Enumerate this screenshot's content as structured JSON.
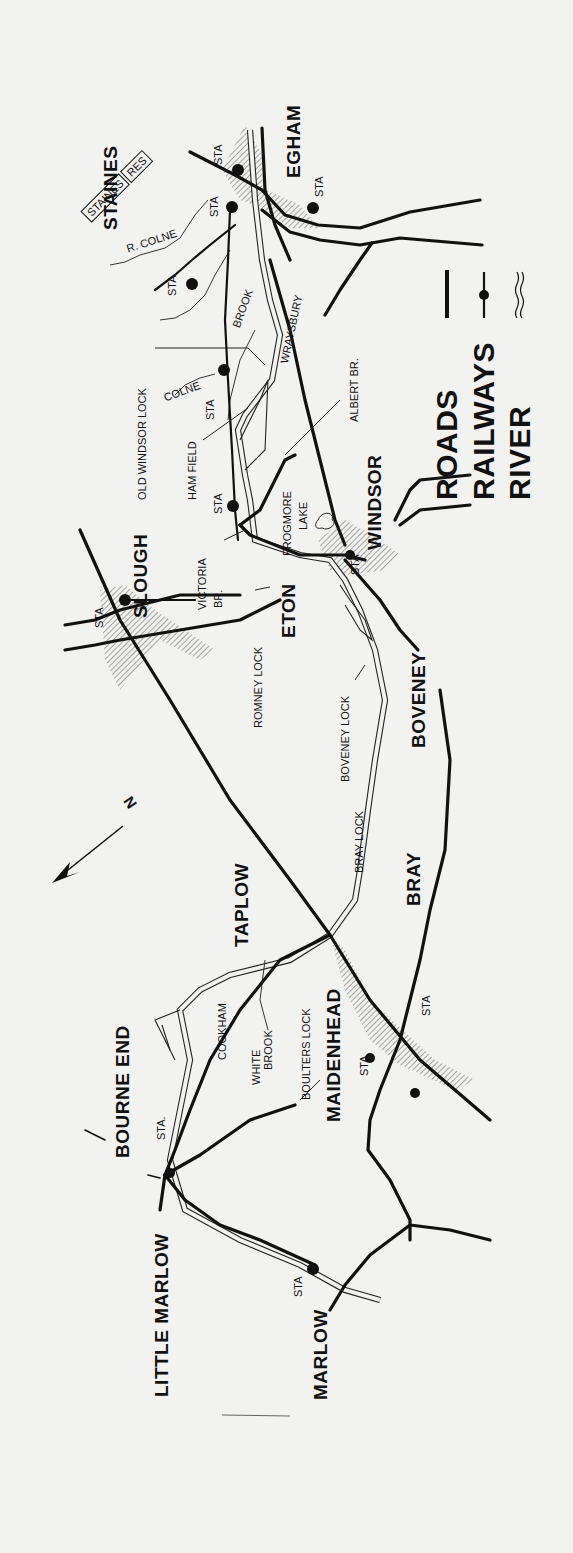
{
  "map": {
    "title": "Thames: Marlow to Staines",
    "orientation": "rotated 90 degrees counter-clockwise",
    "paper_color": "#f2f2f0",
    "ink_color": "#111111",
    "north_arrow": {
      "label": "N",
      "icon": "north-arrow-icon"
    },
    "legend": {
      "items": [
        {
          "label": "ROADS",
          "symbol": "road-line-icon"
        },
        {
          "label": "RAILWAYS",
          "symbol": "railway-line-icon"
        },
        {
          "label": "RIVER",
          "symbol": "river-wavy-icon"
        }
      ]
    },
    "towns": [
      {
        "id": "staines",
        "label": "STAINES"
      },
      {
        "id": "egham",
        "label": "EGHAM"
      },
      {
        "id": "slough",
        "label": "SLOUGH"
      },
      {
        "id": "eton",
        "label": "ETON"
      },
      {
        "id": "windsor",
        "label": "WINDSOR"
      },
      {
        "id": "boveney",
        "label": "BOVENEY"
      },
      {
        "id": "bray",
        "label": "BRAY"
      },
      {
        "id": "taplow",
        "label": "TAPLOW"
      },
      {
        "id": "maidenhead",
        "label": "MAIDENHEAD"
      },
      {
        "id": "bourne_end",
        "label": "BOURNE END"
      },
      {
        "id": "little_marlow",
        "label": "LITTLE MARLOW"
      },
      {
        "id": "marlow",
        "label": "MARLOW"
      }
    ],
    "features": {
      "staines_res": [
        "STAINES",
        "RES"
      ],
      "r_colne": "R. COLNE",
      "colne": "COLNE",
      "brook": "BROOK",
      "wraysbury": "WRAYSBURY",
      "old_windsor_lock": "OLD WINDSOR LOCK",
      "ham_field": "HAM FIELD",
      "albert_br": "ALBERT BR.",
      "frogmore": "FROGMORE",
      "lake": "LAKE",
      "victoria": "VICTORIA",
      "br": "BR.",
      "romney_lock": "ROMNEY LOCK",
      "boveney_lock": "BOVENEY LOCK",
      "bray_lock": "BRAY LOCK",
      "cookham": "COOKHAM",
      "white": "WHITE",
      "white_brook": "BROOK",
      "boulters_lock": "BOULTERS LOCK"
    },
    "stations": {
      "sta": "STA",
      "sta_dot": "STA."
    }
  }
}
